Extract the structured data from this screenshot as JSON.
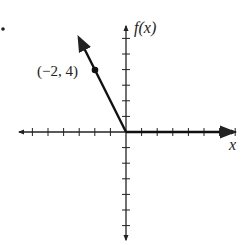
{
  "chart_data": {
    "type": "line",
    "title": "",
    "xlabel": "x",
    "ylabel": "f(x)",
    "xlim": [
      -7,
      7
    ],
    "ylim": [
      -6,
      6
    ],
    "grid": false,
    "x_ticks": [
      -6,
      -5,
      -4,
      -3,
      -2,
      -1,
      1,
      2,
      3,
      4,
      5,
      6,
      7
    ],
    "y_ticks": [
      -6,
      -5,
      -4,
      -3,
      -2,
      -1,
      1,
      2,
      3,
      4,
      5,
      6
    ],
    "series": [
      {
        "name": "f(x)",
        "description": "piecewise: f(x) = -2x for x <= 0, f(x) = 0 for x >= 0",
        "points": [
          [
            -2.9,
            5.8
          ],
          [
            -2,
            4
          ],
          [
            0,
            0
          ],
          [
            7,
            0
          ]
        ],
        "arrows": [
          "left-up",
          "right"
        ]
      }
    ],
    "annotations": [
      {
        "text": "(−2, 4)",
        "x": -2,
        "y": 4,
        "marker": "filled-circle"
      }
    ],
    "bullet": "•"
  }
}
